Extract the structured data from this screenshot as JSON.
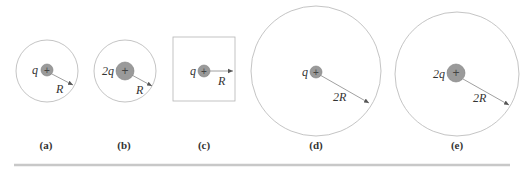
{
  "figure": {
    "colors": {
      "outline": "#b5b5b5",
      "charge_fill": "#9a9a9a",
      "charge_stroke": "#808080",
      "arrow": "#555555",
      "text": "#333333",
      "divider": "#c8c8c8"
    },
    "panels": [
      {
        "id": "a",
        "label": "(a)",
        "shape": "circle",
        "charge": "q",
        "radius_label": "R"
      },
      {
        "id": "b",
        "label": "(b)",
        "shape": "circle",
        "charge": "2q",
        "radius_label": "R"
      },
      {
        "id": "c",
        "label": "(c)",
        "shape": "square",
        "charge": "q",
        "radius_label": "R"
      },
      {
        "id": "d",
        "label": "(d)",
        "shape": "circle",
        "charge": "q",
        "radius_label": "2R"
      },
      {
        "id": "e",
        "label": "(e)",
        "shape": "circle",
        "charge": "2q",
        "radius_label": "2R"
      }
    ],
    "charge_sign": "+"
  }
}
